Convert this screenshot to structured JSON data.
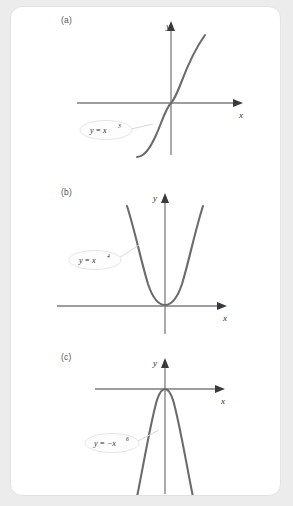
{
  "figure": {
    "background_color": "#ececec",
    "card_color": "#ffffff",
    "border_color": "#e2e2e2",
    "curve_color": "#6b6b6b",
    "axis_color": "#7d7d7d",
    "panels": [
      {
        "id": "a",
        "label": "(a)",
        "x_axis_label": "x",
        "y_axis_label": "y",
        "equation_base": "y = x",
        "equation_exponent": "3",
        "equation_full": "y = x3",
        "curve_type": "odd-power",
        "description": "increasing S-shaped cubic through origin"
      },
      {
        "id": "b",
        "label": "(b)",
        "x_axis_label": "x",
        "y_axis_label": "y",
        "equation_base": "y = x",
        "equation_exponent": "4",
        "equation_full": "y = x4",
        "curve_type": "even-power",
        "description": "upward opening flat-bottomed parabola tangent to x-axis at origin"
      },
      {
        "id": "c",
        "label": "(c)",
        "x_axis_label": "x",
        "y_axis_label": "y",
        "equation_base": "y = −x",
        "equation_exponent": "6",
        "equation_full": "y = −x6",
        "curve_type": "even-power-negated",
        "description": "downward opening curve tangent to x-axis at origin"
      }
    ]
  }
}
